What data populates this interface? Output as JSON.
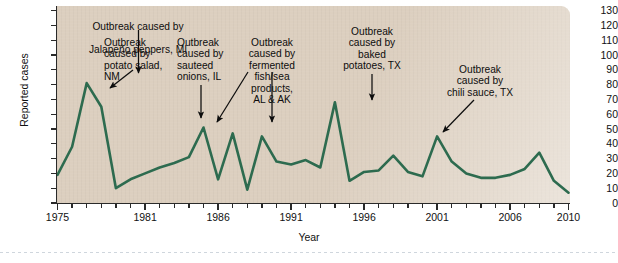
{
  "chart_data": {
    "type": "line",
    "title": "",
    "xlabel": "Year",
    "ylabel": "Reported cases",
    "xlim": [
      1975,
      2010
    ],
    "ylim": [
      0,
      130
    ],
    "y_tick_step": 10,
    "grid": false,
    "legend": "none",
    "line_color": "#2d6b4f",
    "plot_background": "#dccfbf",
    "y_ticks": [
      0,
      10,
      20,
      30,
      40,
      50,
      60,
      70,
      80,
      90,
      100,
      110,
      120,
      130
    ],
    "x_ticks": [
      1975,
      1976,
      1977,
      1978,
      1979,
      1980,
      1981,
      1982,
      1983,
      1984,
      1985,
      1986,
      1987,
      1988,
      1989,
      1990,
      1991,
      1992,
      1993,
      1994,
      1995,
      1996,
      1997,
      1998,
      1999,
      2000,
      2001,
      2002,
      2003,
      2004,
      2005,
      2006,
      2007,
      2008,
      2009,
      2010
    ],
    "x_tick_labels": [
      "1975",
      "1981",
      "1986",
      "1991",
      "1996",
      "2001",
      "2006",
      "2010"
    ],
    "x_tick_label_years": [
      1975,
      1981,
      1986,
      1991,
      1996,
      2001,
      2006,
      2010
    ],
    "x": [
      1975,
      1976,
      1977,
      1978,
      1979,
      1980,
      1981,
      1982,
      1983,
      1984,
      1985,
      1986,
      1987,
      1988,
      1989,
      1990,
      1991,
      1992,
      1993,
      1994,
      1995,
      1996,
      1997,
      1998,
      1999,
      2000,
      2001,
      2002,
      2003,
      2004,
      2005,
      2006,
      2007,
      2008,
      2009,
      2010
    ],
    "values": [
      19,
      38,
      81,
      65,
      10,
      16,
      20,
      24,
      27,
      31,
      51,
      16,
      47,
      9,
      45,
      28,
      26,
      29,
      24,
      68,
      15,
      21,
      22,
      32,
      21,
      18,
      45,
      28,
      20,
      17,
      17,
      19,
      23,
      34,
      15,
      7
    ],
    "annotations": [
      {
        "id": "jalapeno",
        "text": "Outbreak caused by\nJalapeño peppers, MI",
        "target_year": 1977,
        "target_value": 81
      },
      {
        "id": "potato-salad",
        "text": "Outbreak\ncaused by\npotato salad,\nNM",
        "target_year": 1978,
        "target_value": 65
      },
      {
        "id": "sauteed-onions",
        "text": "Outbreak\ncaused by\nsauteed\nonions, IL",
        "target_year": 1985,
        "target_value": 51
      },
      {
        "id": "fermented-fish",
        "text": "Outbreak\ncaused by\nfermented\nfish/sea\nproducts,\nAL & AK",
        "target_year": 1987,
        "target_value": 47,
        "second_target_year": 1989,
        "second_target_value": 45
      },
      {
        "id": "baked-potatoes",
        "text": "Outbreak\ncaused by\nbaked\npotatoes, TX",
        "target_year": 1994,
        "target_value": 68
      },
      {
        "id": "chili-sauce",
        "text": "Outbreak\ncaused by\nchili sauce, TX",
        "target_year": 2001,
        "target_value": 45
      }
    ]
  },
  "axis": {
    "y_title": "Reported cases",
    "x_title": "Year"
  },
  "annotation_text": {
    "jalapeno_line1": "Outbreak caused by",
    "jalapeno_line2": "Jalapeño peppers, MI",
    "potato_salad": "Outbreak\ncaused by\npotato salad,\nNM",
    "sauteed_onions": "Outbreak\ncaused by\nsauteed\nonions, IL",
    "fermented_fish": "Outbreak\ncaused by\nfermented\nfish/sea\nproducts,\nAL & AK",
    "baked_potatoes": "Outbreak\ncaused by\nbaked\npotatoes, TX",
    "chili_sauce": "Outbreak\ncaused by\nchili sauce, TX"
  }
}
